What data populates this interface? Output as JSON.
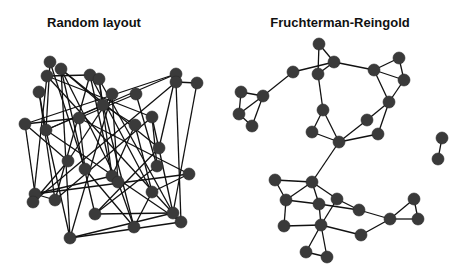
{
  "panels": [
    {
      "id": "random",
      "title": "Random layout",
      "title_x": 94,
      "nodes": [
        [
          50,
          62
        ],
        [
          61,
          69
        ],
        [
          47,
          76
        ],
        [
          39,
          92
        ],
        [
          90,
          75
        ],
        [
          99,
          79
        ],
        [
          112,
          94
        ],
        [
          103,
          105
        ],
        [
          136,
          94
        ],
        [
          176,
          74
        ],
        [
          176,
          82
        ],
        [
          197,
          83
        ],
        [
          25,
          124
        ],
        [
          46,
          130
        ],
        [
          79,
          118
        ],
        [
          152,
          117
        ],
        [
          135,
          125
        ],
        [
          159,
          148
        ],
        [
          68,
          161
        ],
        [
          85,
          169
        ],
        [
          112,
          176
        ],
        [
          118,
          182
        ],
        [
          157,
          166
        ],
        [
          189,
          174
        ],
        [
          35,
          194
        ],
        [
          33,
          202
        ],
        [
          55,
          200
        ],
        [
          95,
          214
        ],
        [
          152,
          192
        ],
        [
          173,
          213
        ],
        [
          181,
          222
        ],
        [
          134,
          227
        ],
        [
          70,
          238
        ]
      ],
      "edges": [
        [
          1,
          7
        ],
        [
          1,
          17
        ],
        [
          1,
          21
        ],
        [
          1,
          27
        ],
        [
          1,
          32
        ],
        [
          2,
          4
        ],
        [
          2,
          25
        ],
        [
          2,
          15
        ],
        [
          0,
          19
        ],
        [
          3,
          26
        ],
        [
          4,
          26
        ],
        [
          4,
          28
        ],
        [
          5,
          7
        ],
        [
          5,
          29
        ],
        [
          5,
          20
        ],
        [
          6,
          18
        ],
        [
          6,
          21
        ],
        [
          7,
          16
        ],
        [
          7,
          31
        ],
        [
          7,
          13
        ],
        [
          8,
          14
        ],
        [
          8,
          22
        ],
        [
          9,
          12
        ],
        [
          9,
          13
        ],
        [
          10,
          30
        ],
        [
          10,
          25
        ],
        [
          11,
          29
        ],
        [
          11,
          10
        ],
        [
          12,
          14
        ],
        [
          12,
          18
        ],
        [
          12,
          24
        ],
        [
          13,
          30
        ],
        [
          13,
          32
        ],
        [
          14,
          23
        ],
        [
          14,
          19
        ],
        [
          15,
          22
        ],
        [
          15,
          26
        ],
        [
          16,
          28
        ],
        [
          16,
          20
        ],
        [
          17,
          27
        ],
        [
          18,
          25
        ],
        [
          18,
          33
        ],
        [
          19,
          31
        ],
        [
          20,
          24
        ],
        [
          21,
          31
        ],
        [
          22,
          27
        ],
        [
          23,
          24
        ],
        [
          23,
          28
        ],
        [
          24,
          26
        ],
        [
          27,
          29
        ],
        [
          28,
          31
        ],
        [
          29,
          32
        ],
        [
          30,
          32
        ],
        [
          3,
          13
        ],
        [
          4,
          20
        ],
        [
          6,
          32
        ],
        [
          9,
          17
        ],
        [
          15,
          29
        ],
        [
          0,
          13
        ],
        [
          2,
          30
        ]
      ]
    },
    {
      "id": "fruchterman-reingold",
      "title": "Fruchterman-Reingold",
      "title_x": 340,
      "nodes": [
        [
          319,
          44
        ],
        [
          334,
          62
        ],
        [
          318,
          74
        ],
        [
          293,
          72
        ],
        [
          263,
          96
        ],
        [
          241,
          92
        ],
        [
          239,
          114
        ],
        [
          252,
          126
        ],
        [
          323,
          110
        ],
        [
          312,
          132
        ],
        [
          339,
          142
        ],
        [
          374,
          70
        ],
        [
          399,
          58
        ],
        [
          404,
          80
        ],
        [
          389,
          102
        ],
        [
          367,
          120
        ],
        [
          378,
          134
        ],
        [
          442,
          138
        ],
        [
          438,
          159
        ],
        [
          312,
          182
        ],
        [
          275,
          180
        ],
        [
          286,
          200
        ],
        [
          319,
          204
        ],
        [
          337,
          199
        ],
        [
          359,
          210
        ],
        [
          321,
          225
        ],
        [
          284,
          226
        ],
        [
          361,
          235
        ],
        [
          390,
          219
        ],
        [
          414,
          199
        ],
        [
          418,
          219
        ],
        [
          306,
          252
        ],
        [
          327,
          257
        ]
      ],
      "edges": [
        [
          0,
          1
        ],
        [
          0,
          2
        ],
        [
          1,
          2
        ],
        [
          1,
          3
        ],
        [
          3,
          4
        ],
        [
          4,
          5
        ],
        [
          4,
          6
        ],
        [
          4,
          7
        ],
        [
          5,
          6
        ],
        [
          6,
          7
        ],
        [
          2,
          8
        ],
        [
          8,
          9
        ],
        [
          8,
          10
        ],
        [
          9,
          10
        ],
        [
          1,
          11
        ],
        [
          11,
          12
        ],
        [
          11,
          13
        ],
        [
          12,
          13
        ],
        [
          13,
          14
        ],
        [
          11,
          14
        ],
        [
          14,
          15
        ],
        [
          14,
          16
        ],
        [
          15,
          10
        ],
        [
          16,
          10
        ],
        [
          17,
          18
        ],
        [
          10,
          19
        ],
        [
          19,
          20
        ],
        [
          19,
          21
        ],
        [
          19,
          22
        ],
        [
          19,
          23
        ],
        [
          20,
          21
        ],
        [
          21,
          22
        ],
        [
          21,
          26
        ],
        [
          22,
          25
        ],
        [
          23,
          24
        ],
        [
          23,
          25
        ],
        [
          22,
          24
        ],
        [
          25,
          26
        ],
        [
          25,
          27
        ],
        [
          24,
          28
        ],
        [
          27,
          28
        ],
        [
          28,
          29
        ],
        [
          28,
          30
        ],
        [
          29,
          30
        ],
        [
          25,
          31
        ],
        [
          25,
          32
        ],
        [
          31,
          32
        ]
      ]
    }
  ],
  "style": {
    "node_color": "#3a3a3a",
    "edge_color": "#111111",
    "node_radius": 6
  }
}
